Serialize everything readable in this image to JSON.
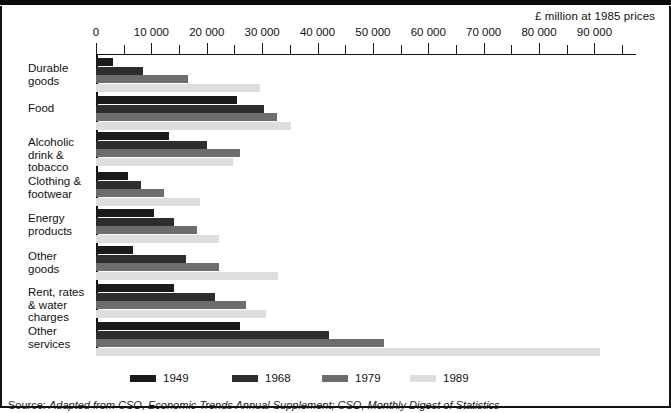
{
  "chart_data": {
    "type": "bar",
    "orientation": "horizontal",
    "title": "",
    "units_caption": "£ million at 1985 prices",
    "xlabel": "",
    "ylabel": "",
    "xlim": [
      0,
      95000
    ],
    "grid": false,
    "legend_position": "bottom",
    "tick_interval": 5000,
    "label_interval": 10000,
    "tick_labels": [
      "0",
      "10 000",
      "20 000",
      "30 000",
      "40 000",
      "50 000",
      "60 000",
      "70 000",
      "80 000",
      "90 000"
    ],
    "tick_values": [
      0,
      10000,
      20000,
      30000,
      40000,
      50000,
      60000,
      70000,
      80000,
      90000
    ],
    "categories": [
      "Durable goods",
      "Food",
      "Alcoholic drink & tobacco",
      "Clothing & footwear",
      "Energy products",
      "Other goods",
      "Rent, rates & water charges",
      "Other services"
    ],
    "category_lines": [
      [
        "Durable",
        "goods"
      ],
      [
        "Food"
      ],
      [
        "Alcoholic",
        "drink &",
        "tobacco"
      ],
      [
        "Clothing &",
        "footwear"
      ],
      [
        "Energy",
        "products"
      ],
      [
        "Other",
        "goods"
      ],
      [
        "Rent, rates",
        "& water",
        "charges"
      ],
      [
        "Other",
        "services"
      ]
    ],
    "series": [
      {
        "name": "1949",
        "color": "#1b1b1b",
        "values": [
          3000,
          25500,
          13200,
          5700,
          10500,
          6700,
          14000,
          26000
        ]
      },
      {
        "name": "1968",
        "color": "#2e2e2e",
        "values": [
          8500,
          30300,
          20000,
          8200,
          14000,
          16200,
          21500,
          42000
        ]
      },
      {
        "name": "1979",
        "color": "#6d6d6d",
        "values": [
          16700,
          32700,
          26000,
          12200,
          18200,
          22200,
          27000,
          52000
        ]
      },
      {
        "name": "1989",
        "color": "#dedede",
        "values": [
          29700,
          35200,
          24700,
          18800,
          22200,
          32900,
          30700,
          91000
        ]
      }
    ]
  },
  "legend": {
    "items": [
      {
        "label": "1949",
        "color": "#1b1b1b"
      },
      {
        "label": "1968",
        "color": "#2e2e2e"
      },
      {
        "label": "1979",
        "color": "#6d6d6d"
      },
      {
        "label": "1989",
        "color": "#dedede"
      }
    ]
  },
  "footer": {
    "source_label": "Source:",
    "source_text": "Adapted from CSO, Economic Trends Annual Supplement; CSO, Monthly Digest of Statistics"
  }
}
